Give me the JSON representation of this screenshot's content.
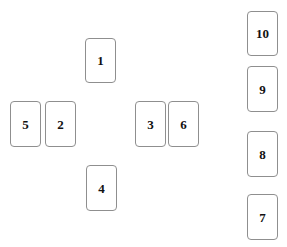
{
  "canvas": {
    "width": 287,
    "height": 247,
    "background_color": "#ffffff"
  },
  "style": {
    "card_border_color": "#8f8f8f",
    "card_fill_color": "#ffffff",
    "card_label_color": "#111111",
    "card_corner_radius": 4
  },
  "layout": {
    "description": "cross-arrangement of six cards on the left with a vertical column of four cards on the right",
    "groups": [
      {
        "name": "cross",
        "card_indices": [
          0,
          1,
          2,
          3,
          4,
          5
        ]
      },
      {
        "name": "right-column",
        "card_indices": [
          6,
          7,
          8,
          9
        ]
      }
    ]
  },
  "cards": [
    {
      "label": "1",
      "position": "cross-top",
      "x": 85,
      "y": 38,
      "width": 31,
      "height": 45
    },
    {
      "label": "5",
      "position": "cross-left-outer",
      "x": 10,
      "y": 101,
      "width": 31,
      "height": 46
    },
    {
      "label": "2",
      "position": "cross-left-inner",
      "x": 45,
      "y": 101,
      "width": 31,
      "height": 46
    },
    {
      "label": "3",
      "position": "cross-right-inner",
      "x": 135,
      "y": 101,
      "width": 31,
      "height": 46
    },
    {
      "label": "6",
      "position": "cross-right-outer",
      "x": 168,
      "y": 101,
      "width": 31,
      "height": 46
    },
    {
      "label": "4",
      "position": "cross-bottom",
      "x": 86,
      "y": 165,
      "width": 31,
      "height": 46
    },
    {
      "label": "10",
      "position": "column-1",
      "x": 247,
      "y": 11,
      "width": 31,
      "height": 45
    },
    {
      "label": "9",
      "position": "column-2",
      "x": 247,
      "y": 66,
      "width": 31,
      "height": 46
    },
    {
      "label": "8",
      "position": "column-3",
      "x": 247,
      "y": 131,
      "width": 31,
      "height": 46
    },
    {
      "label": "7",
      "position": "column-4",
      "x": 247,
      "y": 194,
      "width": 31,
      "height": 46
    }
  ]
}
